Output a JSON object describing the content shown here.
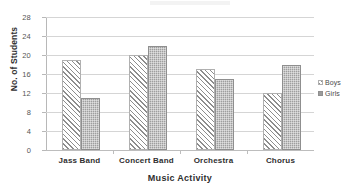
{
  "chart_data": {
    "type": "bar",
    "title": "",
    "xlabel": "Music Activity",
    "ylabel": "No. of Students",
    "categories": [
      "Jass Band",
      "Concert Band",
      "Orchestra",
      "Chorus"
    ],
    "series": [
      {
        "name": "Boys",
        "values": [
          19,
          20,
          17,
          12
        ],
        "fill": "diagonal-hatch",
        "color": "#8d8d8d"
      },
      {
        "name": "Girls",
        "values": [
          11,
          22,
          15,
          18
        ],
        "fill": "solid-stipple",
        "color": "#9e9e9e"
      }
    ],
    "ylim": [
      0,
      28
    ],
    "yticks": [
      0,
      4,
      8,
      12,
      16,
      20,
      24,
      28
    ],
    "ytick_labels": [
      "0",
      "4",
      "8",
      "12",
      "16",
      "20",
      "24",
      "28"
    ],
    "grid": "horizontal",
    "legend_position": "right",
    "background": "#ffffff",
    "gridline_color": "#d5d5d5",
    "axis_color": "#b8b8b8"
  },
  "axes": {
    "y_title": "No. of Students",
    "x_title": "Music Activity"
  },
  "legend": {
    "entries": [
      {
        "label": "Boys"
      },
      {
        "label": "Girls"
      }
    ]
  }
}
